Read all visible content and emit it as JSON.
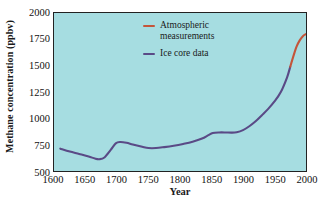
{
  "chart_data": {
    "type": "line",
    "title": "",
    "xlabel": "Year",
    "ylabel": "Methane concentration (ppbv)",
    "xlim": [
      1600,
      2000
    ],
    "ylim": [
      500,
      2000
    ],
    "xticks": [
      "1600",
      "1650",
      "1700",
      "1750",
      "1800",
      "1850",
      "1900",
      "1950",
      "2000"
    ],
    "yticks": [
      "500",
      "750",
      "1000",
      "1250",
      "1500",
      "1750",
      "2000"
    ],
    "grid": false,
    "background_color": "#a6dde1",
    "legend_position": "upper-center",
    "series": [
      {
        "name": "Ice core data",
        "color": "#5a4a86",
        "x": [
          1610,
          1625,
          1640,
          1655,
          1665,
          1672,
          1680,
          1690,
          1698,
          1705,
          1715,
          1725,
          1740,
          1750,
          1762,
          1775,
          1790,
          1805,
          1820,
          1835,
          1845,
          1852,
          1862,
          1872,
          1882,
          1890,
          1900,
          1910,
          1920,
          1930,
          1940,
          1950,
          1960,
          1970,
          1975
        ],
        "y": [
          712,
          685,
          662,
          638,
          618,
          612,
          628,
          700,
          762,
          775,
          768,
          752,
          730,
          718,
          718,
          727,
          740,
          757,
          778,
          808,
          840,
          860,
          866,
          866,
          864,
          868,
          888,
          925,
          972,
          1030,
          1090,
          1160,
          1250,
          1390,
          1490
        ]
      },
      {
        "name": "Atmospheric measurements",
        "color": "#c4553a",
        "x": [
          1975,
          1980,
          1985,
          1990,
          1995,
          2000
        ],
        "y": [
          1490,
          1590,
          1680,
          1740,
          1780,
          1800
        ]
      }
    ]
  },
  "legend": {
    "items": [
      {
        "label": "Atmospheric measurements",
        "color": "#c4553a"
      },
      {
        "label": "Ice core data",
        "color": "#5a4a86"
      }
    ]
  },
  "axes": {
    "x_title": "Year",
    "y_title": "Methane concentration (ppbv)"
  }
}
